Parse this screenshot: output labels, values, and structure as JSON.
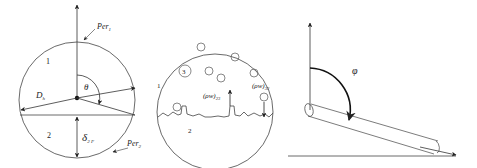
{
  "panel_a": {
    "per1": "Per",
    "per1_sub": "1",
    "per2": "Per",
    "per2_sub": "2",
    "region1": "1",
    "region2": "2",
    "theta": "θ",
    "dh": "D",
    "dh_sub": "h",
    "delta": "δ",
    "delta_sub": "2 F"
  },
  "panel_b": {
    "region1": "1",
    "region2": "2",
    "region3": "3",
    "flux_up": "(ρw)",
    "flux_up_sub": "23",
    "flux_down": "(ρw)",
    "flux_down_sub": "32"
  },
  "panel_c": {
    "phi": "φ"
  },
  "colors": {
    "stroke": "#333333",
    "background": "#ffffff"
  }
}
